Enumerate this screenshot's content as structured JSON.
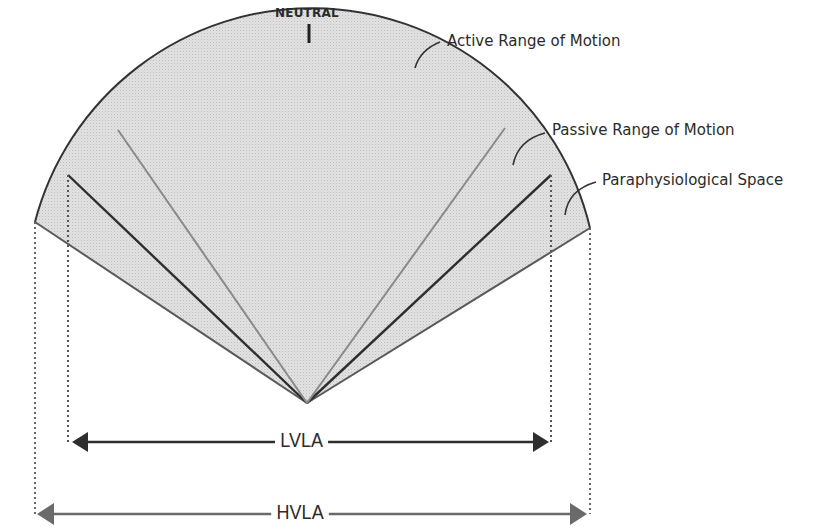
{
  "diagram": {
    "neutral_label": "NEUTRAL",
    "callouts": {
      "active": "Active Range of Motion",
      "passive": "Passive Range of Motion",
      "paraphysiological": "Paraphysiological Space"
    },
    "dimensions": {
      "inner": "LVLA",
      "outer": "HVLA"
    },
    "colors": {
      "fill": "#dadada",
      "arc": "#333333",
      "active_ray": "#8a8a8a",
      "passive_ray": "#2e2e2e",
      "outer_ray": "#5a5a5a",
      "lvla_arrow": "#2e2e2e",
      "hvla_arrow": "#6a6a6a",
      "text": "#2b2b2b"
    }
  }
}
